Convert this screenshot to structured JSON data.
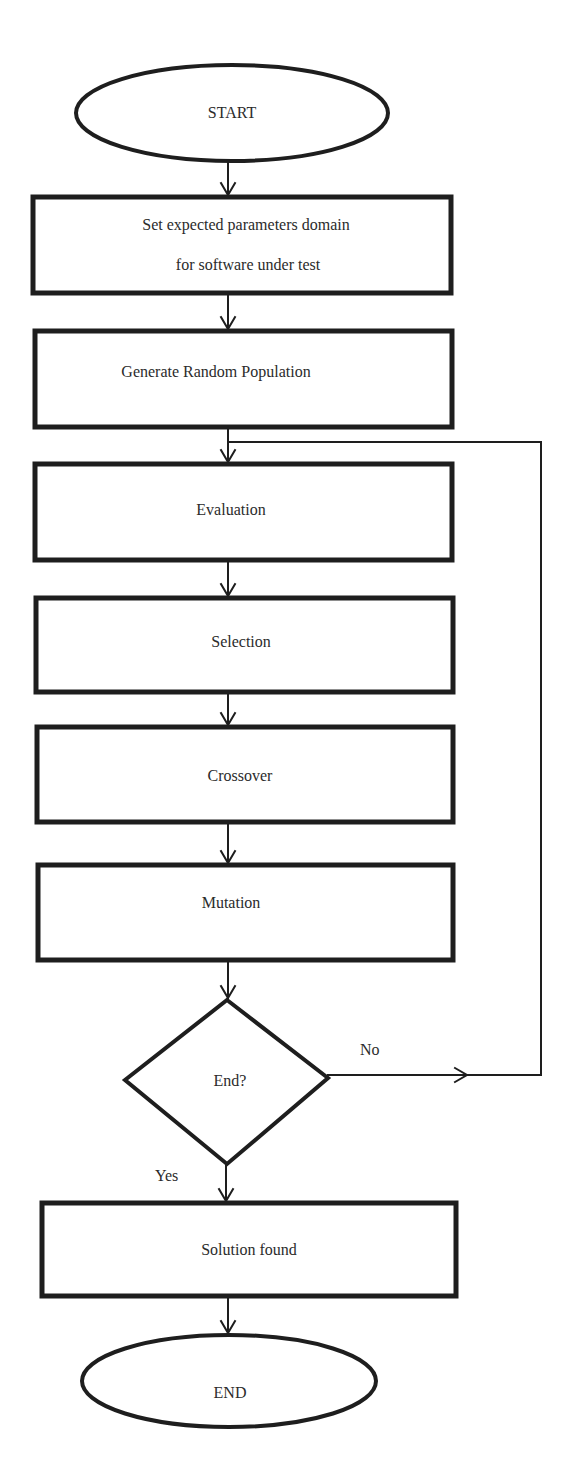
{
  "diagram": {
    "type": "flowchart",
    "title": "",
    "colors": {
      "stroke": "#1e1e1e",
      "text": "#2b2b2b",
      "background": "#ffffff"
    },
    "nodes": [
      {
        "id": "start",
        "shape": "ellipse",
        "label": "START"
      },
      {
        "id": "set_domain",
        "shape": "rect",
        "label_line1": "Set expected parameters domain",
        "label_line2": "for software under test"
      },
      {
        "id": "generate",
        "shape": "rect",
        "label": "Generate Random Population"
      },
      {
        "id": "evaluation",
        "shape": "rect",
        "label": "Evaluation"
      },
      {
        "id": "selection",
        "shape": "rect",
        "label": "Selection"
      },
      {
        "id": "crossover",
        "shape": "rect",
        "label": "Crossover"
      },
      {
        "id": "mutation",
        "shape": "rect",
        "label": "Mutation"
      },
      {
        "id": "end_check",
        "shape": "diamond",
        "label": "End?"
      },
      {
        "id": "solution",
        "shape": "rect",
        "label": "Solution found"
      },
      {
        "id": "end",
        "shape": "ellipse",
        "label": "END"
      }
    ],
    "edges": [
      {
        "from": "start",
        "to": "set_domain",
        "label": ""
      },
      {
        "from": "set_domain",
        "to": "generate",
        "label": ""
      },
      {
        "from": "generate",
        "to": "evaluation",
        "label": ""
      },
      {
        "from": "evaluation",
        "to": "selection",
        "label": ""
      },
      {
        "from": "selection",
        "to": "crossover",
        "label": ""
      },
      {
        "from": "crossover",
        "to": "mutation",
        "label": ""
      },
      {
        "from": "mutation",
        "to": "end_check",
        "label": ""
      },
      {
        "from": "end_check",
        "to": "evaluation",
        "label": "No"
      },
      {
        "from": "end_check",
        "to": "solution",
        "label": "Yes"
      },
      {
        "from": "solution",
        "to": "end",
        "label": ""
      }
    ],
    "edge_labels": {
      "no": "No",
      "yes": "Yes"
    }
  }
}
